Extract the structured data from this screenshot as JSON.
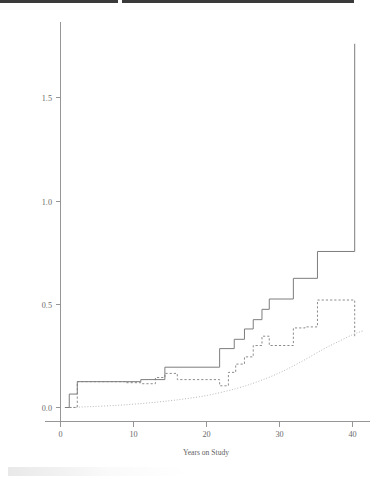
{
  "figure": {
    "background_color": "#ffffff",
    "page_scan_note": ""
  },
  "chart_data": {
    "type": "line",
    "title": "",
    "subtitle": "",
    "xlabel": "Years on Study",
    "ylabel": "",
    "xlim": [
      0,
      42.5
    ],
    "ylim": [
      0.0,
      1.82
    ],
    "grid": false,
    "legend": "none",
    "x_ticks": [
      0,
      10,
      20,
      30,
      40
    ],
    "x_tick_labels": [
      "0",
      "10",
      "20",
      "30",
      "40"
    ],
    "y_ticks": [
      0.0,
      0.5,
      1.0,
      1.5
    ],
    "y_tick_labels": [
      "0.0",
      "0.5",
      "1.0",
      "1.5"
    ],
    "colors": {
      "solid_step": "#7d7d7d",
      "dashed_step": "#8c8c8c",
      "dotted_smooth": "#b0b0b0",
      "axis": "#8a8a8a",
      "tick_text": "#6b6b6b"
    },
    "series": [
      {
        "name": "Nelson-Aalen cumulative hazard (solid step)",
        "style": "solid",
        "shape": "step-post",
        "x": [
          0.6,
          1.2,
          1.2,
          2.3,
          2.3,
          11.0,
          11.0,
          14.3,
          14.3,
          21.8,
          21.8,
          23.8,
          23.8,
          25.2,
          25.2,
          26.4,
          26.4,
          27.6,
          27.6,
          28.6,
          28.6,
          31.9,
          31.9,
          35.2,
          35.2,
          40.3,
          40.3
        ],
        "y": [
          0.0,
          0.0,
          0.065,
          0.065,
          0.125,
          0.125,
          0.135,
          0.135,
          0.195,
          0.195,
          0.285,
          0.285,
          0.33,
          0.33,
          0.38,
          0.38,
          0.425,
          0.425,
          0.475,
          0.475,
          0.525,
          0.525,
          0.625,
          0.625,
          0.755,
          0.755,
          1.76
        ]
      },
      {
        "name": "Alternative estimator (dashed step)",
        "style": "dashed",
        "shape": "step-post",
        "x": [
          1.2,
          2.3,
          2.3,
          9.0,
          9.0,
          11.0,
          11.0,
          13.0,
          13.0,
          14.3,
          14.3,
          16.0,
          16.0,
          21.8,
          21.8,
          23.0,
          23.0,
          24.0,
          24.0,
          25.2,
          25.2,
          26.4,
          26.4,
          27.6,
          27.6,
          28.6,
          28.6,
          31.9,
          31.9,
          33.5,
          33.5,
          35.2,
          35.2,
          40.3,
          40.3
        ],
        "y": [
          0.0,
          0.0,
          0.125,
          0.125,
          0.12,
          0.12,
          0.115,
          0.115,
          0.145,
          0.145,
          0.165,
          0.165,
          0.135,
          0.135,
          0.105,
          0.105,
          0.17,
          0.17,
          0.21,
          0.21,
          0.245,
          0.245,
          0.3,
          0.3,
          0.345,
          0.345,
          0.3,
          0.3,
          0.385,
          0.385,
          0.39,
          0.39,
          0.52,
          0.52,
          0.345
        ]
      },
      {
        "name": "Smooth fitted baseline hazard (dotted)",
        "style": "dotted",
        "shape": "smooth",
        "x": [
          1.0,
          4.0,
          8.0,
          12.0,
          16.0,
          20.0,
          24.0,
          27.0,
          30.0,
          33.0,
          36.0,
          38.0,
          40.0,
          41.5
        ],
        "y": [
          0.0,
          0.004,
          0.011,
          0.022,
          0.037,
          0.058,
          0.091,
          0.125,
          0.168,
          0.222,
          0.282,
          0.318,
          0.352,
          0.372
        ]
      }
    ],
    "annotations": []
  }
}
